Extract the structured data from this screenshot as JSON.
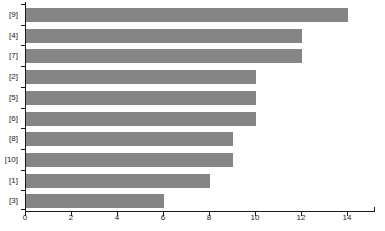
{
  "figure": {
    "background": "#ffffff",
    "bar_color": "#858585",
    "axis_color": "#1a1a1a",
    "text_color": "#1a1a1a"
  },
  "chart_data": {
    "type": "bar",
    "orientation": "horizontal",
    "title": "",
    "xlabel": "",
    "ylabel": "",
    "categories": [
      "[9]",
      "[4]",
      "[7]",
      "[2]",
      "[5]",
      "[6]",
      "[8]",
      "[10]",
      "[1]",
      "[3]"
    ],
    "values": [
      14,
      12,
      12,
      10,
      10,
      10,
      9,
      9,
      8,
      6
    ],
    "x_ticks": [
      "0",
      "2",
      "4",
      "6",
      "8",
      "10",
      "12",
      "14"
    ],
    "x_tick_values": [
      0,
      2,
      4,
      6,
      8,
      10,
      12,
      14
    ],
    "xlim": [
      0,
      15.2
    ],
    "grid": false,
    "legend": "none"
  }
}
